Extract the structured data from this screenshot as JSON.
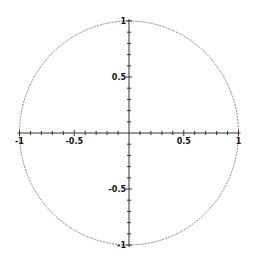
{
  "chart_data": {
    "type": "line",
    "title": "",
    "xlabel": "",
    "ylabel": "",
    "xlim": [
      -1,
      1
    ],
    "ylim": [
      -1,
      1
    ],
    "grid": false,
    "legend": null,
    "series": [
      {
        "name": "unit circle",
        "equation": "x^2 + y^2 = 1",
        "style": "dashed-gray",
        "x": [
          1,
          0.866,
          0.5,
          0,
          -0.5,
          -0.866,
          -1,
          -0.866,
          -0.5,
          0,
          0.5,
          0.866,
          1
        ],
        "y": [
          0,
          0.5,
          0.866,
          1,
          0.866,
          0.5,
          0,
          -0.5,
          -0.866,
          -1,
          -0.866,
          -0.5,
          0
        ]
      }
    ],
    "x_ticks": [
      {
        "value": -1,
        "label": "-1"
      },
      {
        "value": -0.5,
        "label": "-0.5"
      },
      {
        "value": 0.5,
        "label": "0.5"
      },
      {
        "value": 1,
        "label": "1"
      }
    ],
    "y_ticks": [
      {
        "value": 1,
        "label": "1"
      },
      {
        "value": 0.5,
        "label": "0.5"
      },
      {
        "value": -0.5,
        "label": "-0.5"
      },
      {
        "value": -1,
        "label": "-1"
      }
    ],
    "minor_tick_step": 0.1
  },
  "colors": {
    "axis": "#333333",
    "curve": "#888888",
    "labels": "#111111",
    "background": "#ffffff"
  }
}
